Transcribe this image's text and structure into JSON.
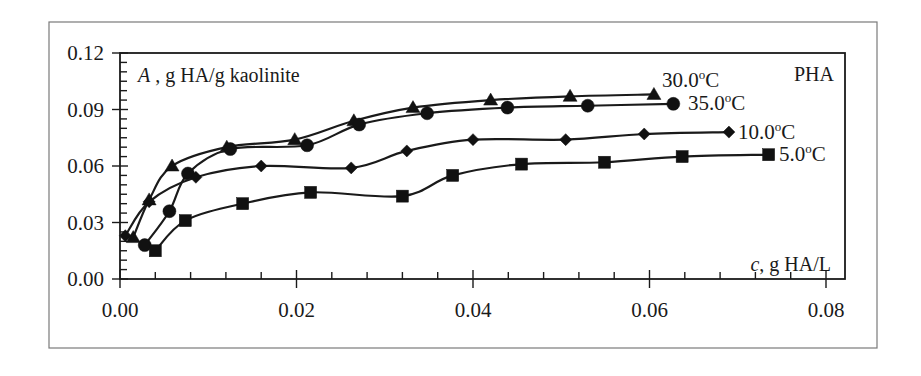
{
  "chart_data": {
    "type": "line",
    "title": "",
    "panel_label": "PHA",
    "xlabel": "c,  g HA/L",
    "xlabel_italic_part": "c",
    "ylabel": "A , g HA/g kaolinite",
    "ylabel_italic_part": "A",
    "xlim": [
      0.0,
      0.082
    ],
    "ylim": [
      0.0,
      0.12
    ],
    "x_ticks": [
      "0.00",
      "0.02",
      "0.04",
      "0.06",
      "0.08"
    ],
    "y_ticks": [
      "0.00",
      "0.03",
      "0.06",
      "0.09",
      "0.12"
    ],
    "grid": false,
    "legend_position": "inline labels at end of each series",
    "series": [
      {
        "name": "30.0°C",
        "marker": "triangle",
        "x": [
          0.0015,
          0.0033,
          0.0059,
          0.0121,
          0.0198,
          0.0265,
          0.0332,
          0.042,
          0.051,
          0.0605
        ],
        "y": [
          0.022,
          0.042,
          0.06,
          0.07,
          0.074,
          0.084,
          0.091,
          0.095,
          0.097,
          0.098
        ]
      },
      {
        "name": "35.0°C",
        "marker": "circle",
        "x": [
          0.0028,
          0.0056,
          0.0077,
          0.0125,
          0.0212,
          0.0271,
          0.0348,
          0.0439,
          0.053,
          0.0627
        ],
        "y": [
          0.018,
          0.036,
          0.056,
          0.069,
          0.071,
          0.082,
          0.088,
          0.091,
          0.092,
          0.093
        ]
      },
      {
        "name": "10.0°C",
        "marker": "diamond",
        "x": [
          0.0006,
          0.0033,
          0.0086,
          0.016,
          0.0262,
          0.0325,
          0.04,
          0.0505,
          0.0594,
          0.069
        ],
        "y": [
          0.023,
          0.041,
          0.054,
          0.06,
          0.059,
          0.068,
          0.074,
          0.074,
          0.077,
          0.078
        ]
      },
      {
        "name": "5.0°C",
        "marker": "square",
        "x": [
          0.004,
          0.0074,
          0.0139,
          0.0216,
          0.032,
          0.0377,
          0.0455,
          0.0549,
          0.0637,
          0.0735
        ],
        "y": [
          0.015,
          0.031,
          0.04,
          0.046,
          0.044,
          0.055,
          0.061,
          0.062,
          0.065,
          0.066
        ]
      }
    ]
  }
}
